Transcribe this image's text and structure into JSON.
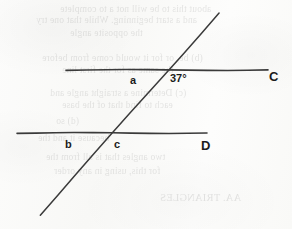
{
  "document": {
    "type": "scanned-worksheet-figure",
    "description": "Hand-drawn geometry figure: two horizontal lines cut by a transversal",
    "background_color": "#fbfbfa",
    "ink_color": "#333333",
    "label_color": "#1b1b1b"
  },
  "figure": {
    "canvas": {
      "width": 292,
      "height": 229
    },
    "lines": [
      {
        "name": "upper-horizontal-line",
        "id": "line-C",
        "x1": 66,
        "y1": 70,
        "x2": 268,
        "y2": 70,
        "stroke": "#3a3a3a",
        "stroke_width": 1.6
      },
      {
        "name": "lower-horizontal-line",
        "id": "line-D",
        "x1": 17,
        "y1": 133,
        "x2": 207,
        "y2": 133,
        "stroke": "#3a3a3a",
        "stroke_width": 1.6
      },
      {
        "name": "transversal-line",
        "id": "transversal",
        "x1": 219,
        "y1": 13,
        "x2": 40,
        "y2": 215,
        "stroke": "#3a3a3a",
        "stroke_width": 1.5
      }
    ],
    "intersections": [
      {
        "name": "upper-intersection",
        "x": 163,
        "y": 70
      },
      {
        "name": "lower-intersection",
        "x": 110,
        "y": 133
      }
    ],
    "labels": [
      {
        "id": "angle-a",
        "text": "a",
        "x": 130,
        "y": 75,
        "size": "small"
      },
      {
        "id": "angle-37",
        "text": "37°",
        "x": 170,
        "y": 73,
        "size": "angle"
      },
      {
        "id": "point-C",
        "text": "C",
        "x": 269,
        "y": 70,
        "size": "cap"
      },
      {
        "id": "angle-b",
        "text": "b",
        "x": 65,
        "y": 139,
        "size": "small"
      },
      {
        "id": "angle-c",
        "text": "c",
        "x": 114,
        "y": 139,
        "size": "small"
      },
      {
        "id": "point-D",
        "text": "D",
        "x": 201,
        "y": 139,
        "size": "cap"
      }
    ]
  },
  "bleed_through_text": [
    {
      "text": "about this to be will not a to complete",
      "x": 60,
      "y": 4,
      "size": 9.5
    },
    {
      "text": "and a start beginning. While that one try",
      "x": 36,
      "y": 15,
      "size": 9.5
    },
    {
      "text": "the opposite angle",
      "x": 70,
      "y": 28,
      "size": 9.5
    },
    {
      "text": "(b) be, or for it would come from before",
      "x": 42,
      "y": 53,
      "size": 9.5
    },
    {
      "text": "the same as for the first line",
      "x": 62,
      "y": 65,
      "size": 9.5
    },
    {
      "text": "(c) Determine a straight angle and",
      "x": 50,
      "y": 88,
      "size": 9.5
    },
    {
      "text": "each to find that of the base",
      "x": 62,
      "y": 100,
      "size": 9.5
    },
    {
      "text": "(d) so",
      "x": 56,
      "y": 116,
      "size": 9.5
    },
    {
      "text": "because it and the",
      "x": 38,
      "y": 133,
      "size": 9.5
    },
    {
      "text": "two angles that is all from the",
      "x": 46,
      "y": 152,
      "size": 9.5
    },
    {
      "text": "for this, using in any order",
      "x": 54,
      "y": 166,
      "size": 9.5
    },
    {
      "text": "AA. TRIANGLES",
      "x": 160,
      "y": 192,
      "size": 10.5
    }
  ]
}
